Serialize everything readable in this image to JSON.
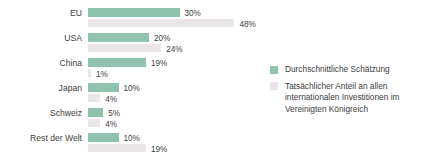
{
  "chart_data": {
    "type": "bar",
    "orientation": "horizontal",
    "title": "",
    "xlabel": "",
    "ylabel": "",
    "xlim": [
      0,
      48
    ],
    "grid": false,
    "legend_position": "right",
    "categories": [
      "EU",
      "USA",
      "China",
      "Japan",
      "Schweiz",
      "Rest der Welt"
    ],
    "series": [
      {
        "name": "Durchschnittliche Schätzung",
        "color": "#8fc3ad",
        "values": [
          30,
          20,
          19,
          10,
          5,
          10
        ],
        "labels": [
          "30%",
          "20%",
          "19%",
          "10%",
          "5%",
          "10%"
        ]
      },
      {
        "name": "Tatsächlicher Anteil an allen internationalen Investitionen im Vereinigten Königreich",
        "color": "#eae5e7",
        "values": [
          48,
          24,
          1,
          4,
          4,
          19
        ],
        "labels": [
          "48%",
          "24%",
          "1%",
          "4%",
          "4%",
          "19%"
        ]
      }
    ]
  },
  "legend": {
    "items": [
      {
        "label": "Durchschnittliche Schätzung"
      },
      {
        "label": "Tatsächlicher Anteil an allen internationalen Investitionen im Vereinigten Königreich"
      }
    ]
  }
}
